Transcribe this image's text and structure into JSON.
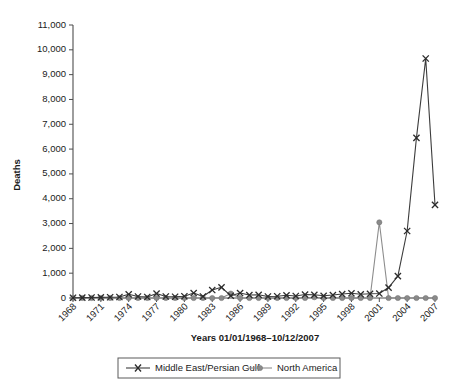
{
  "chart_data": {
    "type": "line",
    "title": "",
    "xlabel": "Years 01/01/1968–10/12/2007",
    "ylabel": "Deaths",
    "ylim": [
      0,
      11000
    ],
    "ytick_labels": [
      "0",
      "1,000",
      "2,000",
      "3,000",
      "4,000",
      "5,000",
      "6,000",
      "7,000",
      "8,000",
      "9,000",
      "10,000",
      "11,000"
    ],
    "ytick_values": [
      0,
      1000,
      2000,
      3000,
      4000,
      5000,
      6000,
      7000,
      8000,
      9000,
      10000,
      11000
    ],
    "xtick_labels": [
      "1968",
      "1971",
      "1974",
      "1977",
      "1980",
      "1983",
      "1986",
      "1989",
      "1992",
      "1995",
      "1998",
      "2001",
      "2004",
      "2007"
    ],
    "xtick_values": [
      1968,
      1971,
      1974,
      1977,
      1980,
      1983,
      1986,
      1989,
      1992,
      1995,
      1998,
      2001,
      2004,
      2007
    ],
    "x": [
      1968,
      1969,
      1970,
      1971,
      1972,
      1973,
      1974,
      1975,
      1976,
      1977,
      1978,
      1979,
      1980,
      1981,
      1982,
      1983,
      1984,
      1985,
      1986,
      1987,
      1988,
      1989,
      1990,
      1991,
      1992,
      1993,
      1994,
      1995,
      1996,
      1997,
      1998,
      1999,
      2000,
      2001,
      2002,
      2003,
      2004,
      2005,
      2006,
      2007
    ],
    "grid": false,
    "legend_position": "bottom",
    "series": [
      {
        "name": "Middle East/Persian Gulf",
        "marker": "x",
        "color": "#3c3c3c",
        "values": [
          10,
          15,
          20,
          25,
          30,
          40,
          150,
          60,
          40,
          180,
          60,
          50,
          70,
          200,
          60,
          320,
          430,
          90,
          200,
          120,
          130,
          60,
          70,
          110,
          80,
          140,
          130,
          90,
          120,
          160,
          190,
          150,
          170,
          180,
          420,
          880,
          2700,
          6450,
          9650,
          3750
        ]
      },
      {
        "name": "North America",
        "marker": "dot",
        "color": "#8a8a8a",
        "values": [
          0,
          0,
          0,
          0,
          0,
          0,
          0,
          0,
          0,
          0,
          0,
          0,
          0,
          0,
          0,
          0,
          0,
          180,
          0,
          0,
          0,
          0,
          0,
          0,
          0,
          0,
          30,
          0,
          0,
          0,
          0,
          0,
          0,
          3050,
          0,
          0,
          0,
          0,
          0,
          0
        ]
      }
    ]
  },
  "legend": {
    "items": [
      {
        "label": "Middle East/Persian Gulf",
        "marker": "x"
      },
      {
        "label": "North America",
        "marker": "dot"
      }
    ]
  },
  "axes": {
    "y_title": "Deaths",
    "x_title": "Years 01/01/1968–10/12/2007"
  },
  "colors": {
    "series_middle_east": "#3c3c3c",
    "series_north_america": "#8a8a8a",
    "axis": "#4d4d4d",
    "text": "#1a1a1a",
    "background": "#ffffff"
  }
}
